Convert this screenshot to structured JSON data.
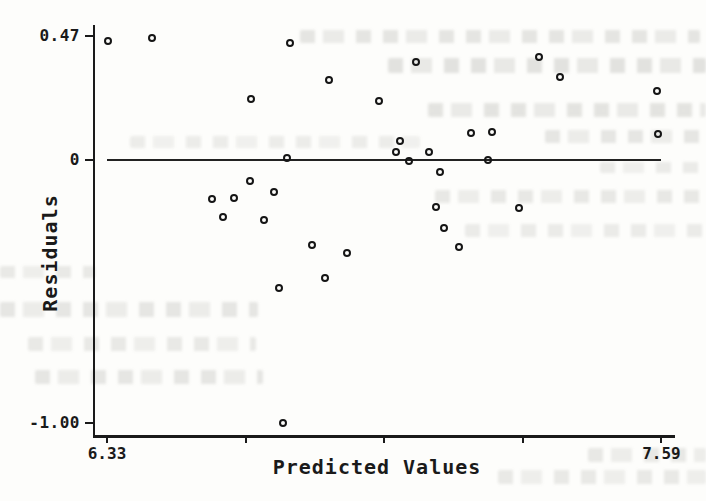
{
  "colors": {
    "ink": "#1a1a1a",
    "paper": "#fdfdfb",
    "bleedthrough": "#707069"
  },
  "chart_data": {
    "type": "scatter",
    "title": "",
    "xlabel": "Predicted Values",
    "ylabel": "Residuals",
    "xlim": [
      6.33,
      7.59
    ],
    "ylim": [
      -1.0,
      0.47
    ],
    "grid": false,
    "legend": "none",
    "marker": "open-circle",
    "reference_line_y": 0,
    "x_ticks": {
      "labeled": [
        {
          "value": 6.33,
          "label": "6.33"
        },
        {
          "value": 7.59,
          "label": "7.59"
        }
      ],
      "unlabeled_values": [
        6.645,
        6.96,
        7.275
      ]
    },
    "y_ticks": [
      {
        "value": 0.47,
        "label": "0.47"
      },
      {
        "value": 0,
        "label": "0"
      },
      {
        "value": -1.0,
        "label": "-1.00"
      }
    ],
    "points": [
      [
        6.332,
        0.452
      ],
      [
        6.432,
        0.464
      ],
      [
        6.746,
        0.445
      ],
      [
        7.033,
        0.373
      ],
      [
        7.312,
        0.392
      ],
      [
        7.36,
        0.316
      ],
      [
        7.58,
        0.262
      ],
      [
        6.835,
        0.304
      ],
      [
        6.657,
        0.232
      ],
      [
        6.948,
        0.224
      ],
      [
        7.583,
        0.099
      ],
      [
        7.157,
        0.103
      ],
      [
        7.205,
        0.106
      ],
      [
        6.996,
        0.072
      ],
      [
        6.987,
        0.03
      ],
      [
        7.062,
        0.03
      ],
      [
        6.739,
        0.008
      ],
      [
        7.016,
        -0.004
      ],
      [
        7.196,
        0.0
      ],
      [
        7.087,
        -0.046
      ],
      [
        6.655,
        -0.08
      ],
      [
        6.71,
        -0.122
      ],
      [
        6.619,
        -0.144
      ],
      [
        6.569,
        -0.148
      ],
      [
        7.078,
        -0.179
      ],
      [
        7.266,
        -0.183
      ],
      [
        6.594,
        -0.217
      ],
      [
        6.687,
        -0.228
      ],
      [
        7.096,
        -0.259
      ],
      [
        6.796,
        -0.323
      ],
      [
        7.13,
        -0.331
      ],
      [
        6.876,
        -0.354
      ],
      [
        6.826,
        -0.449
      ],
      [
        6.721,
        -0.487
      ],
      [
        6.73,
        -1.0
      ]
    ]
  }
}
